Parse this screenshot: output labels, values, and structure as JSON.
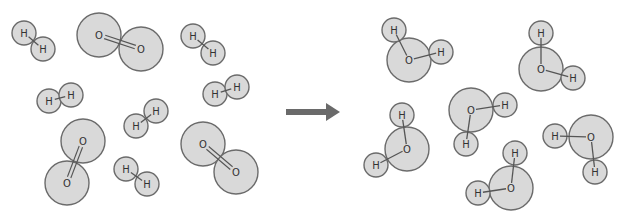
{
  "colors": {
    "atom_fill": "#d9d9d9",
    "atom_stroke": "#6b6b6b",
    "bond": "#555555",
    "label": "#333333",
    "arrow": "#6a6a6a",
    "background": "#ffffff"
  },
  "atom_radius": {
    "H": 12,
    "O": 22
  },
  "reactants": {
    "hydrogen_molecules": [
      {
        "label": "H2",
        "atoms": [
          {
            "el": "H",
            "x": 24,
            "y": 33
          },
          {
            "el": "H",
            "x": 43,
            "y": 49
          }
        ]
      },
      {
        "label": "H2",
        "atoms": [
          {
            "el": "H",
            "x": 193,
            "y": 36
          },
          {
            "el": "H",
            "x": 213,
            "y": 53
          }
        ]
      },
      {
        "label": "H2",
        "atoms": [
          {
            "el": "H",
            "x": 215,
            "y": 94
          },
          {
            "el": "H",
            "x": 237,
            "y": 87
          }
        ]
      },
      {
        "label": "H2",
        "atoms": [
          {
            "el": "H",
            "x": 49,
            "y": 101
          },
          {
            "el": "H",
            "x": 71,
            "y": 95
          }
        ]
      },
      {
        "label": "H2",
        "atoms": [
          {
            "el": "H",
            "x": 136,
            "y": 126
          },
          {
            "el": "H",
            "x": 156,
            "y": 111
          }
        ]
      },
      {
        "label": "H2",
        "atoms": [
          {
            "el": "H",
            "x": 126,
            "y": 169
          },
          {
            "el": "H",
            "x": 147,
            "y": 184
          }
        ]
      }
    ],
    "oxygen_molecules": [
      {
        "label": "O2",
        "atoms": [
          {
            "el": "O",
            "x": 99,
            "y": 35
          },
          {
            "el": "O",
            "x": 141,
            "y": 49
          }
        ]
      },
      {
        "label": "O2",
        "atoms": [
          {
            "el": "O",
            "x": 83,
            "y": 141
          },
          {
            "el": "O",
            "x": 67,
            "y": 183
          }
        ]
      },
      {
        "label": "O2",
        "atoms": [
          {
            "el": "O",
            "x": 203,
            "y": 144
          },
          {
            "el": "O",
            "x": 236,
            "y": 172
          }
        ]
      }
    ]
  },
  "arrow": {
    "x1": 286,
    "y1": 112,
    "x2": 340,
    "y2": 112,
    "label": "yields"
  },
  "products": {
    "water_molecules": [
      {
        "label": "H2O",
        "O": {
          "x": 409,
          "y": 60
        },
        "H": [
          {
            "x": 394,
            "y": 30
          },
          {
            "x": 441,
            "y": 52
          }
        ]
      },
      {
        "label": "H2O",
        "O": {
          "x": 541,
          "y": 69
        },
        "H": [
          {
            "x": 541,
            "y": 33
          },
          {
            "x": 573,
            "y": 78
          }
        ]
      },
      {
        "label": "H2O",
        "O": {
          "x": 471,
          "y": 110
        },
        "H": [
          {
            "x": 505,
            "y": 105
          },
          {
            "x": 466,
            "y": 144
          }
        ]
      },
      {
        "label": "H2O",
        "O": {
          "x": 407,
          "y": 149
        },
        "H": [
          {
            "x": 402,
            "y": 115
          },
          {
            "x": 376,
            "y": 165
          }
        ]
      },
      {
        "label": "H2O",
        "O": {
          "x": 511,
          "y": 188
        },
        "H": [
          {
            "x": 515,
            "y": 153
          },
          {
            "x": 478,
            "y": 193
          }
        ]
      },
      {
        "label": "H2O",
        "O": {
          "x": 591,
          "y": 137
        },
        "H": [
          {
            "x": 555,
            "y": 136
          },
          {
            "x": 595,
            "y": 172
          }
        ]
      }
    ]
  },
  "atom_labels": {
    "H": "H",
    "O": "O"
  }
}
